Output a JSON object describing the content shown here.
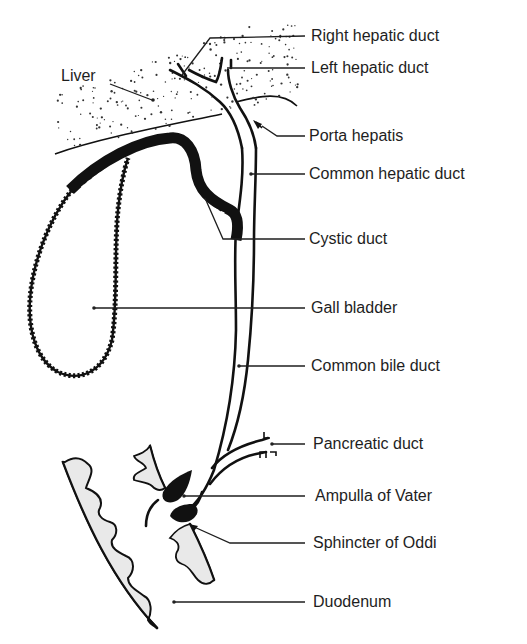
{
  "figure": {
    "ink_color": "#111111",
    "background": "#ffffff"
  },
  "labels": {
    "liver": "Liver",
    "right_hepatic_duct": "Right hepatic duct",
    "left_hepatic_duct": "Left hepatic duct",
    "porta_hepatis": "Porta hepatis",
    "common_hepatic_duct": "Common hepatic duct",
    "cystic_duct": "Cystic duct",
    "gall_bladder": "Gall bladder",
    "common_bile_duct": "Common bile duct",
    "pancreatic_duct": "Pancreatic duct",
    "ampulla_of_vater": "Ampulla of Vater",
    "sphincter_of_oddi": "Sphincter of Oddi",
    "duodenum": "Duodenum"
  }
}
